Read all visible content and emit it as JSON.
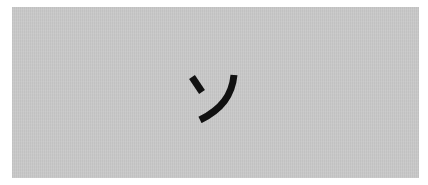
{
  "card": {
    "character": "ソ",
    "character_reading": "so",
    "script": "katakana",
    "background_color": "#c9c9c9",
    "text_color": "#111111"
  }
}
